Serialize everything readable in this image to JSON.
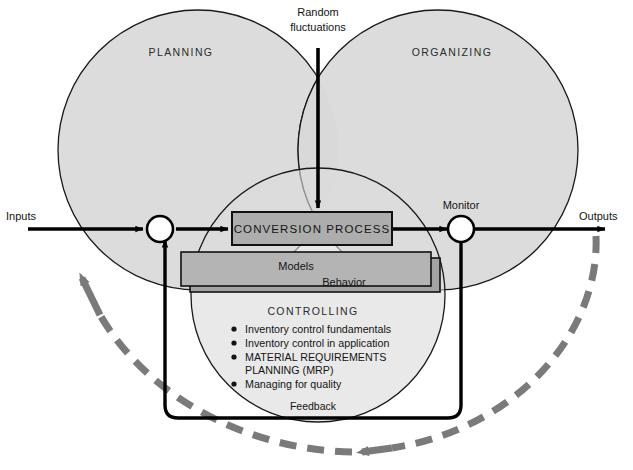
{
  "diagram": {
    "title_top": {
      "line1": "Random",
      "line2": "fluctuations"
    },
    "circles": [
      {
        "id": "planning",
        "label": "PLANNING"
      },
      {
        "id": "organizing",
        "label": "ORGANIZING"
      },
      {
        "id": "controlling",
        "label": "CONTROLLING"
      }
    ],
    "edges": {
      "input_label": "Inputs",
      "output_label": "Outputs",
      "feedback_label": "Feedback"
    },
    "nodes": {
      "monitor_label": "Monitor"
    },
    "process_box": {
      "label": "CONVERSION PROCESS"
    },
    "sub_boxes": [
      {
        "id": "models",
        "label": "Models"
      },
      {
        "id": "behavior",
        "label": "Behavior"
      }
    ],
    "bullets": [
      "Inventory control fundamentals",
      "Inventory control in application",
      "MATERIAL REQUIREMENTS",
      "PLANNING (MRP)",
      "Managing for quality"
    ],
    "colors": {
      "circle_fill": "#dcdcdc",
      "circle_stroke": "#1a1a1a",
      "process_fill": "#adadad",
      "models_fill": "#b4b4b4",
      "behavior_fill": "#a3a3a3",
      "line": "#000000",
      "dashed_arc": "#7a7a7a",
      "background": "#ffffff",
      "text": "#141414"
    }
  }
}
